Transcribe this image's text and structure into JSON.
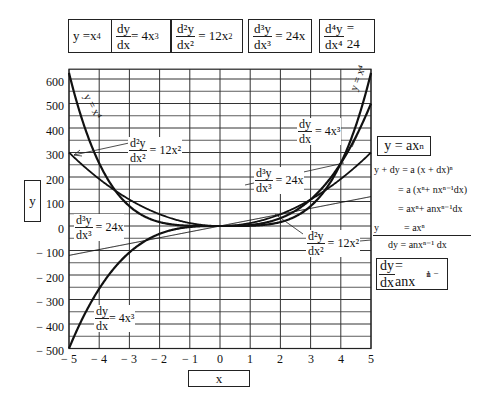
{
  "header_equations": [
    {
      "text": "y = x^4",
      "lhs": "y =x",
      "exp": "4"
    },
    {
      "num": "dy",
      "den": "dx",
      "rhs": "= 4x",
      "exp": "3"
    },
    {
      "num": "d²y",
      "den": "dx²",
      "rhs": "= 12x",
      "exp": "2"
    },
    {
      "num": "d³y",
      "den": "dx³",
      "rhs": "= 24x"
    },
    {
      "num": "d⁴y",
      "den": "dx⁴",
      "rhs": "= 24"
    }
  ],
  "axes": {
    "y_label": "y",
    "x_label": "x",
    "y_ticks": [
      "600",
      "500",
      "400",
      "300",
      "200",
      "100",
      "0",
      "− 100",
      "− 200",
      "− 300",
      "− 400",
      "− 500"
    ],
    "x_ticks": [
      "− 5",
      "− 4",
      "− 3",
      "− 2",
      "− 1",
      "0",
      "1",
      "2",
      "3",
      "4",
      "5"
    ]
  },
  "curve_labels": {
    "y_left": "y = x⁴",
    "y_right": "y = x⁴",
    "d2_left": {
      "num": "d²y",
      "den": "dx²",
      "rhs": "= 12x²"
    },
    "d3_left": {
      "num": "d³y",
      "den": "dx³",
      "rhs": "= 24x"
    },
    "d1_left": {
      "num": "dy",
      "den": "dx",
      "rhs": "= 4x³"
    },
    "d1_right": {
      "num": "dy",
      "den": "dx",
      "rhs": "= 4x³"
    },
    "d3_right": {
      "num": "d³y",
      "den": "dx³",
      "rhs": "= 24x"
    },
    "d2_right": {
      "num": "d²y",
      "den": "dx²",
      "rhs": "= 12x²"
    }
  },
  "derivation": {
    "title": "y = ax",
    "title_exp": "n",
    "lines": [
      "y + dy = a (x + dx)ⁿ",
      "= a (xⁿ+ nxⁿ⁻¹dx)",
      "= axⁿ+ anxⁿ⁻¹dx",
      "y          = axⁿ",
      "dy = anxⁿ⁻¹ dx"
    ],
    "result_num": "dy",
    "result_den": "dx",
    "result_rhs": "= anx",
    "result_exp": "n − 1"
  },
  "chart_data": {
    "type": "line",
    "title": "",
    "xlabel": "x",
    "ylabel": "y",
    "xlim": [
      -5,
      5
    ],
    "ylim": [
      -500,
      640
    ],
    "grid": true,
    "x": [
      -5,
      -4,
      -3,
      -2,
      -1,
      0,
      1,
      2,
      3,
      4,
      5
    ],
    "series": [
      {
        "name": "y = x^4",
        "values": [
          625,
          256,
          81,
          16,
          1,
          0,
          1,
          16,
          81,
          256,
          625
        ]
      },
      {
        "name": "dy/dx = 4x^3",
        "values": [
          -500,
          -256,
          -108,
          -32,
          -4,
          0,
          4,
          32,
          108,
          256,
          500
        ]
      },
      {
        "name": "d2y/dx2 = 12x^2",
        "values": [
          300,
          192,
          108,
          48,
          12,
          0,
          12,
          48,
          108,
          192,
          300
        ]
      },
      {
        "name": "d3y/dx3 = 24x",
        "values": [
          -120,
          -96,
          -72,
          -48,
          -24,
          0,
          24,
          48,
          72,
          96,
          120
        ]
      },
      {
        "name": "d4y/dx4 = 24",
        "values": [
          24,
          24,
          24,
          24,
          24,
          24,
          24,
          24,
          24,
          24,
          24
        ]
      }
    ]
  }
}
